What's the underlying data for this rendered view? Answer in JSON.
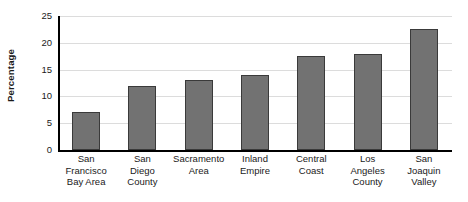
{
  "chart_data": {
    "type": "bar",
    "title": "",
    "xlabel": "",
    "ylabel": "Percentage",
    "ylim": [
      0,
      25
    ],
    "yticks": [
      0,
      5,
      10,
      15,
      20,
      25
    ],
    "ytick_labels": [
      "0",
      "5",
      "10",
      "15",
      "20",
      "25"
    ],
    "grid": true,
    "legend": false,
    "categories": [
      "San Francisco Bay Area",
      "San Diego County",
      "Sacramento Area",
      "Inland Empire",
      "Central Coast",
      "Los Angeles County",
      "San Joaquin Valley"
    ],
    "category_lines": [
      [
        "San",
        "Francisco",
        "Bay Area"
      ],
      [
        "San",
        "Diego",
        "County"
      ],
      [
        "Sacramento",
        "Area"
      ],
      [
        "Inland",
        "Empire"
      ],
      [
        "Central",
        "Coast"
      ],
      [
        "Los",
        "Angeles",
        "County"
      ],
      [
        "San",
        "Joaquin",
        "Valley"
      ]
    ],
    "values": [
      7,
      12,
      13,
      14,
      17.5,
      18,
      22.5
    ],
    "colors": {
      "bar_fill": "#727272",
      "bar_border": "#3a3a3a",
      "axis": "#000000",
      "gridline": "#dcdcdc",
      "text": "#1a1a1a",
      "background": "#ffffff"
    }
  }
}
